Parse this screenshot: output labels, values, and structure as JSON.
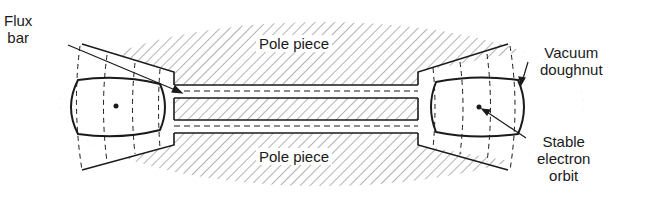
{
  "diagram": {
    "type": "betatron cross-section",
    "labels": {
      "flux_bar_1": "Flux",
      "flux_bar_2": "bar",
      "pole_piece_top": "Pole piece",
      "pole_piece_bottom": "Pole piece",
      "vacuum_1": "Vacuum",
      "vacuum_2": "doughnut",
      "stable_1": "Stable",
      "stable_2": "electron",
      "stable_3": "orbit"
    },
    "colors": {
      "ink": "#1a1a1a",
      "hatch": "#555555",
      "background": "#ffffff"
    }
  }
}
